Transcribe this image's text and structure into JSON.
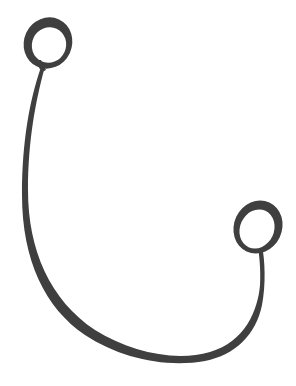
{
  "image": {
    "subject": "curved ribbon with two loops",
    "colors": {
      "background": "#ffffff",
      "ribbon": "#3f3f3f",
      "ribbon_shade": "#4a4a4a"
    }
  }
}
